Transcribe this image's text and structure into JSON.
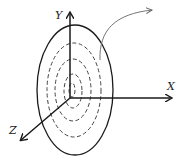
{
  "diagram": {
    "type": "3d-coordinate-system-with-concentric-ellipses",
    "axes": {
      "x_label": "X",
      "y_label": "Y",
      "z_label": "Z"
    },
    "outer_ellipse": {
      "style": "solid"
    },
    "inner_ellipses": {
      "count": 4,
      "style": "dashed"
    },
    "annotation_arrow": {
      "style": "curved",
      "direction": "up-right"
    },
    "colors": {
      "stroke": "#1a1a1a",
      "dashed": "#444444",
      "annotation": "#666666",
      "background": "#ffffff"
    }
  }
}
